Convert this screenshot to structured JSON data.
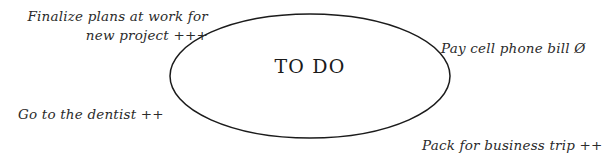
{
  "diagram": {
    "title": "TO DO",
    "center_label": "TO DO",
    "shape": "ellipse",
    "stroke_color": "#1b1b1b",
    "text_color": "#2b2b2b",
    "background_color": "#ffffff"
  },
  "notes": {
    "top_left": {
      "line1": "Finalize plans at work for",
      "line2": "new project +++",
      "priority": "+++"
    },
    "bottom_left": {
      "text": "Go to the dentist ++",
      "priority": "++"
    },
    "top_right": {
      "text": "Pay cell phone bill Ø",
      "priority": "Ø"
    },
    "bottom_right": {
      "text": "Pack for business trip ++",
      "priority": "++"
    }
  }
}
